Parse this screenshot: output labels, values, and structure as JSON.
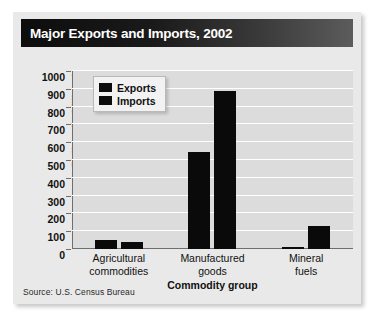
{
  "card": {
    "title": "Major Exports and Imports, 2002",
    "source": "Source: U.S. Census Bureau"
  },
  "chart_data": {
    "type": "bar",
    "title": "Major Exports and Imports, 2002",
    "subtitle": "",
    "xlabel": "Commodity group",
    "ylabel": "Dollars (in billions)",
    "ylim": [
      0,
      1000
    ],
    "yticks": [
      0,
      100,
      200,
      300,
      400,
      500,
      600,
      700,
      800,
      900,
      1000
    ],
    "ytick_labels": [
      "0",
      "100",
      "200",
      "300",
      "400",
      "500",
      "600",
      "700",
      "800",
      "900",
      "1000"
    ],
    "grid": true,
    "legend_position": "upper-left-inside",
    "categories": [
      "Agricultural commodities",
      "Manufactured goods",
      "Mineral fuels"
    ],
    "category_lines": [
      [
        "Agricultural",
        "commodities"
      ],
      [
        "Manufactured",
        "goods"
      ],
      [
        "Mineral",
        "fuels"
      ]
    ],
    "series": [
      {
        "name": "Exports",
        "color": "#0a0a0a",
        "values": [
          50,
          545,
          12
        ]
      },
      {
        "name": "Imports",
        "color": "#0a0a0a",
        "values": [
          40,
          885,
          130
        ]
      }
    ],
    "annotations": [],
    "source": "Source: U.S. Census Bureau"
  },
  "colors": {
    "bar": "#0a0a0a",
    "plot_background": "#dcdcdc",
    "gridline": "#ffffff",
    "card_background": "#e9e9e9",
    "title_bar_dark": "#0d0d0d",
    "title_text": "#ffffff",
    "axis": "#6e6e6e"
  }
}
